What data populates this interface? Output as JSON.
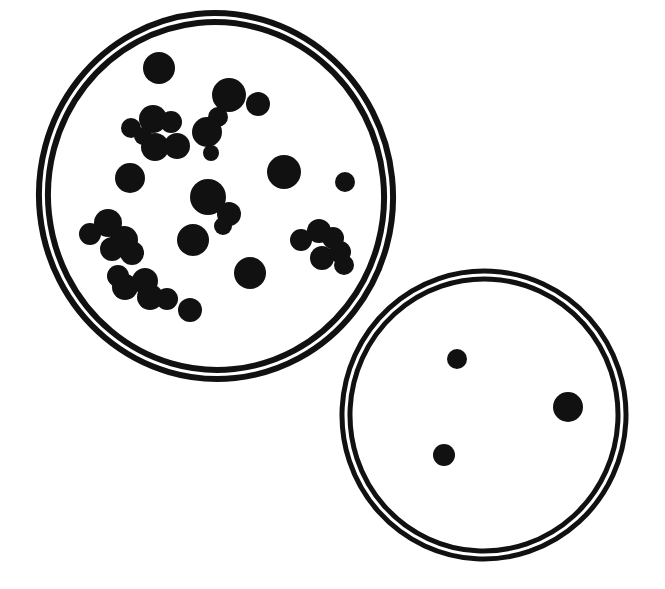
{
  "figure": {
    "caption": "",
    "width": 665,
    "height": 589,
    "background_color": "#ffffff",
    "ink_color": "#111111",
    "style": "black-and-white line illustration"
  },
  "chart_data": {
    "type": "scatter",
    "subtitle": "",
    "xlabel": "",
    "ylabel": "",
    "grid": false,
    "legend": "none",
    "xlim": [
      0,
      665
    ],
    "ylim": [
      0,
      589
    ],
    "units": "pixels",
    "series": [
      {
        "name": "Dense plate colonies",
        "count": 37,
        "values": [
          {
            "x": 159,
            "y": 68,
            "r": 16
          },
          {
            "x": 229,
            "y": 95,
            "r": 17
          },
          {
            "x": 258,
            "y": 104,
            "r": 12
          },
          {
            "x": 218,
            "y": 117,
            "r": 10
          },
          {
            "x": 207,
            "y": 132,
            "r": 15
          },
          {
            "x": 131,
            "y": 128,
            "r": 10
          },
          {
            "x": 153,
            "y": 119,
            "r": 14
          },
          {
            "x": 171,
            "y": 122,
            "r": 11
          },
          {
            "x": 155,
            "y": 147,
            "r": 14
          },
          {
            "x": 177,
            "y": 146,
            "r": 13
          },
          {
            "x": 130,
            "y": 178,
            "r": 15
          },
          {
            "x": 284,
            "y": 172,
            "r": 17
          },
          {
            "x": 345,
            "y": 182,
            "r": 10
          },
          {
            "x": 208,
            "y": 197,
            "r": 18
          },
          {
            "x": 229,
            "y": 214,
            "r": 12
          },
          {
            "x": 193,
            "y": 240,
            "r": 16
          },
          {
            "x": 250,
            "y": 273,
            "r": 16
          },
          {
            "x": 90,
            "y": 234,
            "r": 11
          },
          {
            "x": 108,
            "y": 223,
            "r": 14
          },
          {
            "x": 124,
            "y": 240,
            "r": 14
          },
          {
            "x": 112,
            "y": 249,
            "r": 12
          },
          {
            "x": 132,
            "y": 253,
            "r": 12
          },
          {
            "x": 125,
            "y": 287,
            "r": 13
          },
          {
            "x": 145,
            "y": 281,
            "r": 13
          },
          {
            "x": 150,
            "y": 297,
            "r": 13
          },
          {
            "x": 167,
            "y": 299,
            "r": 11
          },
          {
            "x": 190,
            "y": 310,
            "r": 12
          },
          {
            "x": 118,
            "y": 276,
            "r": 11
          },
          {
            "x": 301,
            "y": 240,
            "r": 11
          },
          {
            "x": 319,
            "y": 231,
            "r": 12
          },
          {
            "x": 333,
            "y": 238,
            "r": 11
          },
          {
            "x": 322,
            "y": 258,
            "r": 12
          },
          {
            "x": 340,
            "y": 252,
            "r": 11
          },
          {
            "x": 344,
            "y": 265,
            "r": 10
          },
          {
            "x": 211,
            "y": 153,
            "r": 8
          },
          {
            "x": 143,
            "y": 136,
            "r": 9
          },
          {
            "x": 223,
            "y": 226,
            "r": 9
          }
        ]
      },
      {
        "name": "Sparse plate colonies",
        "count": 3,
        "values": [
          {
            "x": 457,
            "y": 359,
            "r": 10
          },
          {
            "x": 568,
            "y": 407,
            "r": 15
          },
          {
            "x": 444,
            "y": 455,
            "r": 11
          }
        ]
      }
    ]
  },
  "dishes": [
    {
      "id": "large-dish",
      "label": "Dense colony plate",
      "colony_count": 37,
      "center": {
        "x": 216,
        "y": 196
      },
      "outer_rx": 177,
      "outer_ry": 183,
      "inner_rx": 168,
      "inner_ry": 174,
      "rotation_deg": -6,
      "rim_stroke_width": 6,
      "rim_color": "#111111"
    },
    {
      "id": "small-dish",
      "label": "Sparse colony plate",
      "colony_count": 3,
      "center": {
        "x": 484,
        "y": 415
      },
      "outer_rx": 142,
      "outer_ry": 144,
      "inner_rx": 134,
      "inner_ry": 136,
      "rotation_deg": 3,
      "rim_stroke_width": 5,
      "rim_color": "#111111"
    }
  ]
}
